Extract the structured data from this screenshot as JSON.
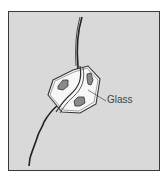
{
  "figure": {
    "background_color": "#d9d9d9",
    "border_color": "#3a3a3a",
    "labels": {
      "glass": "Glass"
    },
    "components": [
      "fiber-line",
      "glass-bead"
    ]
  }
}
